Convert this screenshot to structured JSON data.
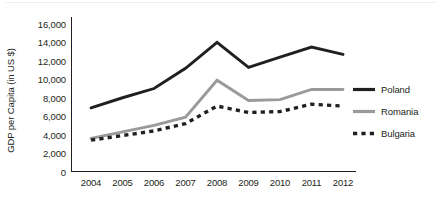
{
  "chart_data": {
    "type": "line",
    "title": "",
    "xlabel": "",
    "ylabel": "GDP per Capita (in US $)",
    "categories": [
      "2004",
      "2005",
      "2006",
      "2007",
      "2008",
      "2009",
      "2010",
      "2011",
      "2012"
    ],
    "ylim": [
      0,
      16000
    ],
    "yticks": [
      0,
      2000,
      4000,
      6000,
      8000,
      10000,
      12000,
      14000,
      16000
    ],
    "ytick_labels": [
      "0",
      "2,000",
      "4,000",
      "6,000",
      "8,000",
      "10,000",
      "12,000",
      "14,000",
      "16,000"
    ],
    "grid": false,
    "legend_position": "right",
    "series": [
      {
        "name": "Poland",
        "color": "#231f20",
        "style": "solid",
        "values": [
          6900,
          8000,
          9000,
          11200,
          14000,
          11300,
          12400,
          13500,
          12700
        ]
      },
      {
        "name": "Romania",
        "color": "#9a9a9a",
        "style": "solid",
        "values": [
          3600,
          4300,
          5000,
          5900,
          9900,
          7700,
          7800,
          8900,
          8900
        ]
      },
      {
        "name": "Bulgaria",
        "color": "#231f20",
        "style": "dashed",
        "values": [
          3400,
          3900,
          4400,
          5200,
          7100,
          6400,
          6500,
          7300,
          7100
        ]
      }
    ]
  },
  "legend": {
    "items": [
      {
        "label": "Poland"
      },
      {
        "label": "Romania"
      },
      {
        "label": "Bulgaria"
      }
    ]
  }
}
